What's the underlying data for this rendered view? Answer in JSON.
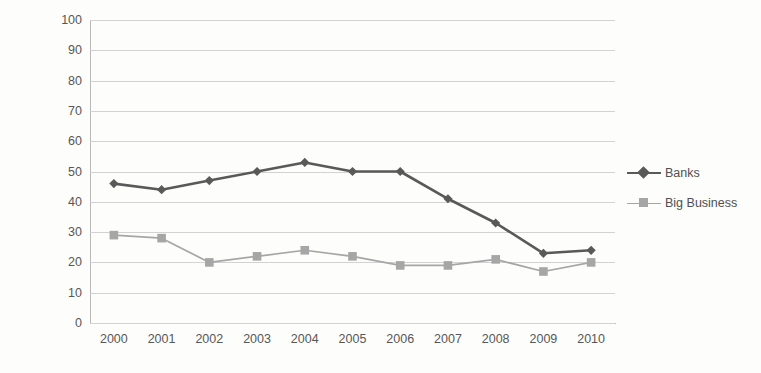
{
  "chart_data": {
    "type": "line",
    "title": "",
    "xlabel": "",
    "ylabel": "percent answering \"Great Deal\"/\"Quite a lot\"",
    "categories": [
      "2000",
      "2001",
      "2002",
      "2003",
      "2004",
      "2005",
      "2006",
      "2007",
      "2008",
      "2009",
      "2010"
    ],
    "ylim": [
      0,
      100
    ],
    "ytick_step": 10,
    "yticks": [
      "100",
      "90",
      "80",
      "70",
      "60",
      "50",
      "40",
      "30",
      "20",
      "10",
      "0"
    ],
    "grid": "horizontal",
    "legend_position": "right",
    "series": [
      {
        "name": "Banks",
        "color": "#595959",
        "marker": "diamond",
        "values": [
          46,
          44,
          47,
          50,
          53,
          50,
          50,
          41,
          33,
          23,
          24
        ]
      },
      {
        "name": "Big Business",
        "color": "#a6a6a6",
        "marker": "square",
        "values": [
          29,
          28,
          20,
          22,
          24,
          22,
          19,
          19,
          21,
          17,
          20
        ]
      }
    ]
  }
}
